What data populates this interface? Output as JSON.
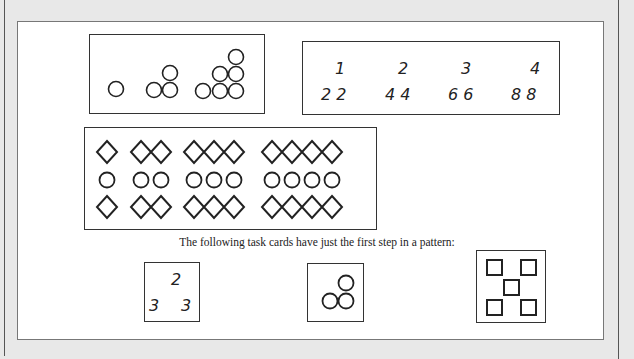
{
  "figure": {
    "panel_circles": {
      "description": "Growing triangular pattern of circles",
      "steps": [
        1,
        3,
        6
      ]
    },
    "panel_numbers": {
      "top_row": [
        "1",
        "2",
        "3",
        "4"
      ],
      "bottom_row": [
        "2 2",
        "4 4",
        "6 6",
        "8 8"
      ]
    },
    "panel_diamonds": {
      "description": "Rows of diamond, circle, diamond repeated",
      "rows": [
        "diamond",
        "circle",
        "diamond"
      ],
      "counts": [
        1,
        2,
        3,
        4
      ]
    },
    "caption": "The following task cards have just the first step in a pattern:",
    "task_cards": [
      {
        "type": "numbers",
        "top": "2",
        "bottom_left": "3",
        "bottom_right": "3"
      },
      {
        "type": "circles",
        "count": 3
      },
      {
        "type": "squares",
        "count": 5
      }
    ]
  }
}
